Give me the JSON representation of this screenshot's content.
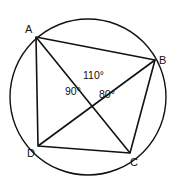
{
  "diagram": {
    "type": "cyclic-quadrilateral",
    "circle": {
      "cx": 88,
      "cy": 97,
      "r": 78
    },
    "points": {
      "A": {
        "label": "A",
        "x": 36,
        "y": 37
      },
      "B": {
        "label": "B",
        "x": 155,
        "y": 60
      },
      "C": {
        "label": "C",
        "x": 130,
        "y": 153
      },
      "D": {
        "label": "D",
        "x": 38,
        "y": 146
      }
    },
    "intersection": {
      "x": 89,
      "y": 92
    },
    "angles": {
      "top": "110°",
      "left": "90°",
      "right": "80°"
    },
    "stroke_color": "#111111"
  }
}
